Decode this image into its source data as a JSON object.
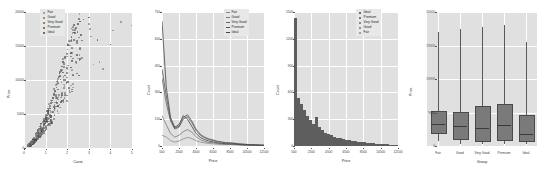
{
  "figure": {
    "panel_count": 4,
    "background": "#ffffff",
    "panel_bg": "#e0e0e0",
    "grid_color": "#ffffff"
  },
  "palette": {
    "Fair": "#8a8a8a",
    "Good": "#777777",
    "Very Good": "#666666",
    "Premium": "#555555",
    "Ideal": "#444444",
    "point": "#6f6f6f",
    "bar": "#5e5e5e",
    "box_fill": "#7a7a7a",
    "line": "#5a5a5a"
  },
  "chart_data": [
    {
      "type": "scatter",
      "title": "",
      "xlabel": "Carat",
      "ylabel": "Price",
      "xlim": [
        0,
        5
      ],
      "ylim": [
        0,
        20000
      ],
      "xticks": [
        0,
        1,
        2,
        3,
        4,
        5
      ],
      "xticklabels": [
        "0",
        "1",
        "2",
        "3",
        "4",
        "5"
      ],
      "yticks": [
        0,
        5000,
        10000,
        15000,
        20000
      ],
      "yticklabels": [
        "0",
        "5000",
        "10000",
        "15000",
        "20000"
      ],
      "grid": true,
      "legend_position": "top-left",
      "legend": [
        "Fair",
        "Good",
        "Very Good",
        "Premium",
        "Ideal"
      ],
      "marker": "dot",
      "points": [
        {
          "x": 0.23,
          "y": 326,
          "g": "Ideal"
        },
        {
          "x": 0.21,
          "y": 326,
          "g": "Premium"
        },
        {
          "x": 0.23,
          "y": 327,
          "g": "Good"
        },
        {
          "x": 0.29,
          "y": 334,
          "g": "Premium"
        },
        {
          "x": 0.31,
          "y": 335,
          "g": "Good"
        },
        {
          "x": 0.24,
          "y": 336,
          "g": "Very Good"
        },
        {
          "x": 0.24,
          "y": 336,
          "g": "Very Good"
        },
        {
          "x": 0.26,
          "y": 337,
          "g": "Very Good"
        },
        {
          "x": 0.22,
          "y": 337,
          "g": "Fair"
        },
        {
          "x": 0.23,
          "y": 338,
          "g": "Very Good"
        },
        {
          "x": 0.3,
          "y": 339,
          "g": "Good"
        },
        {
          "x": 0.23,
          "y": 340,
          "g": "Ideal"
        },
        {
          "x": 0.22,
          "y": 342,
          "g": "Premium"
        },
        {
          "x": 0.31,
          "y": 344,
          "g": "Ideal"
        },
        {
          "x": 0.2,
          "y": 345,
          "g": "Premium"
        },
        {
          "x": 0.32,
          "y": 345,
          "g": "Premium"
        },
        {
          "x": 0.3,
          "y": 348,
          "g": "Ideal"
        },
        {
          "x": 0.3,
          "y": 351,
          "g": "Good"
        },
        {
          "x": 0.3,
          "y": 351,
          "g": "Good"
        },
        {
          "x": 0.3,
          "y": 351,
          "g": "Very Good"
        },
        {
          "x": 0.42,
          "y": 552,
          "g": "Premium"
        },
        {
          "x": 0.4,
          "y": 945,
          "g": "Premium"
        },
        {
          "x": 0.45,
          "y": 1080,
          "g": "Ideal"
        },
        {
          "x": 0.5,
          "y": 1200,
          "g": "Ideal"
        },
        {
          "x": 0.51,
          "y": 1300,
          "g": "Very Good"
        },
        {
          "x": 0.55,
          "y": 1400,
          "g": "Premium"
        },
        {
          "x": 0.58,
          "y": 1500,
          "g": "Good"
        },
        {
          "x": 0.61,
          "y": 1600,
          "g": "Ideal"
        },
        {
          "x": 0.65,
          "y": 1750,
          "g": "Very Good"
        },
        {
          "x": 0.7,
          "y": 1900,
          "g": "Premium"
        },
        {
          "x": 0.71,
          "y": 2100,
          "g": "Ideal"
        },
        {
          "x": 0.74,
          "y": 2250,
          "g": "Very Good"
        },
        {
          "x": 0.78,
          "y": 2400,
          "g": "Good"
        },
        {
          "x": 0.8,
          "y": 2600,
          "g": "Premium"
        },
        {
          "x": 0.83,
          "y": 2800,
          "g": "Ideal"
        },
        {
          "x": 0.9,
          "y": 3100,
          "g": "Very Good"
        },
        {
          "x": 0.91,
          "y": 3300,
          "g": "Premium"
        },
        {
          "x": 0.95,
          "y": 3600,
          "g": "Ideal"
        },
        {
          "x": 1.0,
          "y": 3900,
          "g": "Good"
        },
        {
          "x": 1.01,
          "y": 4200,
          "g": "Very Good"
        },
        {
          "x": 1.02,
          "y": 4500,
          "g": "Premium"
        },
        {
          "x": 1.05,
          "y": 4800,
          "g": "Ideal"
        },
        {
          "x": 1.1,
          "y": 5100,
          "g": "Very Good"
        },
        {
          "x": 1.12,
          "y": 5400,
          "g": "Premium"
        },
        {
          "x": 1.2,
          "y": 5800,
          "g": "Ideal"
        },
        {
          "x": 1.21,
          "y": 6200,
          "g": "Good"
        },
        {
          "x": 1.25,
          "y": 6600,
          "g": "Very Good"
        },
        {
          "x": 1.3,
          "y": 7000,
          "g": "Premium"
        },
        {
          "x": 1.33,
          "y": 7400,
          "g": "Ideal"
        },
        {
          "x": 1.4,
          "y": 7900,
          "g": "Very Good"
        },
        {
          "x": 1.45,
          "y": 8400,
          "g": "Premium"
        },
        {
          "x": 1.5,
          "y": 8900,
          "g": "Ideal"
        },
        {
          "x": 1.51,
          "y": 9400,
          "g": "Good"
        },
        {
          "x": 1.55,
          "y": 9900,
          "g": "Very Good"
        },
        {
          "x": 1.6,
          "y": 10400,
          "g": "Premium"
        },
        {
          "x": 1.65,
          "y": 11000,
          "g": "Ideal"
        },
        {
          "x": 1.7,
          "y": 11500,
          "g": "Very Good"
        },
        {
          "x": 1.75,
          "y": 12000,
          "g": "Premium"
        },
        {
          "x": 1.8,
          "y": 12600,
          "g": "Ideal"
        },
        {
          "x": 1.9,
          "y": 13200,
          "g": "Good"
        },
        {
          "x": 2.0,
          "y": 13900,
          "g": "Very Good"
        },
        {
          "x": 2.01,
          "y": 14500,
          "g": "Premium"
        },
        {
          "x": 2.05,
          "y": 15100,
          "g": "Ideal"
        },
        {
          "x": 2.1,
          "y": 15700,
          "g": "Very Good"
        },
        {
          "x": 2.2,
          "y": 16300,
          "g": "Premium"
        },
        {
          "x": 2.3,
          "y": 17000,
          "g": "Ideal"
        },
        {
          "x": 2.4,
          "y": 17600,
          "g": "Very Good"
        },
        {
          "x": 2.5,
          "y": 18200,
          "g": "Premium"
        },
        {
          "x": 2.6,
          "y": 18600,
          "g": "Ideal"
        },
        {
          "x": 2.75,
          "y": 18900,
          "g": "Very Good"
        },
        {
          "x": 3.0,
          "y": 19200,
          "g": "Premium"
        },
        {
          "x": 3.01,
          "y": 18200,
          "g": "Fair"
        },
        {
          "x": 3.05,
          "y": 17500,
          "g": "Fair"
        },
        {
          "x": 3.11,
          "y": 16400,
          "g": "Fair"
        },
        {
          "x": 3.22,
          "y": 12300,
          "g": "Fair"
        },
        {
          "x": 3.4,
          "y": 15900,
          "g": "Premium"
        },
        {
          "x": 3.5,
          "y": 12600,
          "g": "Fair"
        },
        {
          "x": 3.65,
          "y": 11600,
          "g": "Fair"
        },
        {
          "x": 4.0,
          "y": 15200,
          "g": "Very Good"
        },
        {
          "x": 4.01,
          "y": 15200,
          "g": "Premium"
        },
        {
          "x": 4.13,
          "y": 17300,
          "g": "Fair"
        },
        {
          "x": 4.5,
          "y": 18500,
          "g": "Fair"
        },
        {
          "x": 5.01,
          "y": 18000,
          "g": "Fair"
        }
      ]
    },
    {
      "type": "line",
      "title": "",
      "xlabel": "Price",
      "ylabel": "Count",
      "xlim": [
        500,
        12500
      ],
      "ylim": [
        0,
        750
      ],
      "xticks": [
        500,
        2500,
        4500,
        6500,
        8500,
        10500,
        12500
      ],
      "xticklabels": [
        "500",
        "2500",
        "4500",
        "6500",
        "8500",
        "10500",
        "12500"
      ],
      "yticks": [
        0,
        150,
        300,
        450,
        600,
        750
      ],
      "yticklabels": [
        "0",
        "150",
        "300",
        "450",
        "600",
        "750"
      ],
      "grid": true,
      "legend_position": "top-right",
      "x": [
        500,
        1000,
        1500,
        2000,
        2500,
        3000,
        3500,
        4000,
        4500,
        5000,
        5500,
        6000,
        6500,
        7000,
        7500,
        8000,
        8500,
        9000,
        9500,
        10000,
        10500,
        11000,
        11500,
        12000,
        12500
      ],
      "series": [
        {
          "name": "Fair",
          "values": [
            60,
            50,
            30,
            22,
            28,
            40,
            48,
            42,
            30,
            22,
            18,
            14,
            12,
            10,
            9,
            8,
            8,
            7,
            6,
            5,
            4,
            4,
            3,
            3,
            2
          ]
        },
        {
          "name": "Good",
          "values": [
            170,
            120,
            70,
            50,
            60,
            80,
            92,
            78,
            52,
            36,
            26,
            20,
            18,
            14,
            12,
            10,
            10,
            9,
            7,
            6,
            5,
            5,
            4,
            3,
            3
          ]
        },
        {
          "name": "Very Good",
          "values": [
            380,
            240,
            140,
            95,
            105,
            150,
            165,
            130,
            88,
            60,
            46,
            36,
            30,
            24,
            20,
            17,
            16,
            14,
            11,
            9,
            8,
            7,
            6,
            5,
            4
          ]
        },
        {
          "name": "Premium",
          "values": [
            430,
            280,
            150,
            100,
            110,
            160,
            175,
            140,
            95,
            66,
            50,
            40,
            34,
            27,
            23,
            19,
            18,
            16,
            13,
            11,
            9,
            8,
            7,
            6,
            5
          ]
        },
        {
          "name": "Ideal",
          "values": [
            700,
            330,
            160,
            105,
            120,
            170,
            150,
            110,
            70,
            48,
            36,
            28,
            23,
            18,
            15,
            13,
            12,
            11,
            9,
            7,
            6,
            5,
            5,
            4,
            3
          ]
        }
      ]
    },
    {
      "type": "bar",
      "subtype": "stacked-histogram",
      "title": "",
      "xlabel": "Price",
      "ylabel": "Count",
      "xlim": [
        500,
        12500
      ],
      "ylim": [
        0,
        1500
      ],
      "xticks": [
        500,
        2500,
        4500,
        6500,
        8500,
        10500,
        12500
      ],
      "xticklabels": [
        "500",
        "2500",
        "4500",
        "6500",
        "8500",
        "10500",
        "12500"
      ],
      "yticks": [
        0,
        300,
        600,
        900,
        1200,
        1500
      ],
      "yticklabels": [
        "0",
        "300",
        "600",
        "900",
        "1200",
        "1500"
      ],
      "grid": true,
      "legend_position": "top-right",
      "legend": [
        "Ideal",
        "Premium",
        "Very Good",
        "Good",
        "Fair"
      ],
      "categories": [
        500,
        850,
        1200,
        1550,
        1900,
        2250,
        2600,
        2950,
        3300,
        3650,
        4000,
        4350,
        4700,
        5050,
        5400,
        5750,
        6100,
        6450,
        6800,
        7150,
        7500,
        7850,
        8200,
        8550,
        8900,
        9250,
        9600,
        9950,
        10300,
        10650,
        11000,
        11350,
        11700,
        12050,
        12400
      ],
      "values": [
        1430,
        540,
        470,
        400,
        340,
        290,
        250,
        330,
        210,
        175,
        150,
        130,
        118,
        105,
        95,
        86,
        78,
        70,
        64,
        58,
        53,
        48,
        44,
        40,
        36,
        33,
        30,
        27,
        24,
        22,
        20,
        18,
        16,
        14,
        12
      ]
    },
    {
      "type": "box",
      "title": "",
      "xlabel": "Group",
      "ylabel": "Price",
      "ylim": [
        0,
        20000
      ],
      "yticks": [
        0,
        5000,
        10000,
        15000,
        20000
      ],
      "yticklabels": [
        "0",
        "5000",
        "10000",
        "15000",
        "20000"
      ],
      "grid": true,
      "categories": [
        "Fair",
        "Good",
        "Very Good",
        "Premium",
        "Ideal"
      ],
      "boxes": [
        {
          "name": "Fair",
          "whisker_low": 700,
          "q1": 2050,
          "median": 3282,
          "q3": 5205,
          "whisker_high": 17000
        },
        {
          "name": "Good",
          "whisker_low": 330,
          "q1": 1145,
          "median": 3050,
          "q3": 5028,
          "whisker_high": 17500
        },
        {
          "name": "Very Good",
          "whisker_low": 330,
          "q1": 912,
          "median": 2648,
          "q3": 6000,
          "whisker_high": 17800
        },
        {
          "name": "Premium",
          "whisker_low": 330,
          "q1": 1046,
          "median": 3185,
          "q3": 6296,
          "whisker_high": 18000
        },
        {
          "name": "Ideal",
          "whisker_low": 330,
          "q1": 878,
          "median": 1810,
          "q3": 4678,
          "whisker_high": 15500
        }
      ]
    }
  ]
}
